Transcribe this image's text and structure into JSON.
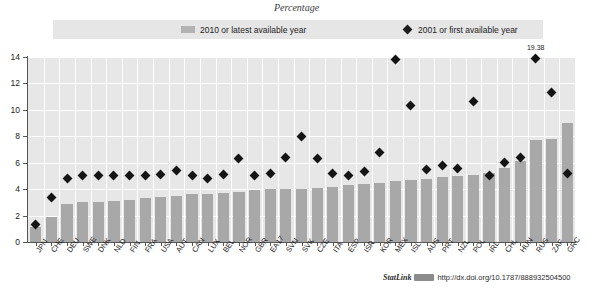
{
  "title": "Percentage",
  "legend": {
    "bar_label": "2010 or latest available year",
    "diamond_label": "2001 or first available year",
    "bar_color": "#b3b3b3",
    "diamond_color": "#1c1c1c"
  },
  "footer": {
    "statlink_word": "StatLink",
    "statlink_icon": "statlink-badge-icon",
    "url": "http://dx.doi.org/10.1787/888932504500"
  },
  "annotation": {
    "text": "19.38",
    "category": "RUS"
  },
  "chart_data": {
    "type": "bar",
    "title": "Percentage",
    "xlabel": "",
    "ylabel": "Percentage",
    "ylim": [
      0,
      14
    ],
    "yticks": [
      0,
      2,
      4,
      6,
      8,
      10,
      12,
      14
    ],
    "grid": true,
    "legend_position": "top",
    "categories": [
      "JPN",
      "CHE",
      "DEU",
      "SWE",
      "DNK",
      "NLD",
      "FIN",
      "FRA",
      "USA",
      "AUT",
      "CAN",
      "LUX",
      "BEL",
      "NOR",
      "GBR",
      "EA17",
      "SVN",
      "SVK",
      "CZE",
      "ITA",
      "ESP",
      "ISR",
      "KOR",
      "MEX",
      "ISL",
      "AUS",
      "PRT",
      "NZL",
      "POL",
      "IRL",
      "CHL",
      "HUN",
      "RUS",
      "ZAF",
      "GRC"
    ],
    "series": [
      {
        "name": "2010 or latest available year",
        "type": "bar",
        "values": [
          1.1,
          1.9,
          2.9,
          3.0,
          3.0,
          3.1,
          3.2,
          3.3,
          3.4,
          3.5,
          3.6,
          3.6,
          3.7,
          3.8,
          3.9,
          4.0,
          4.0,
          4.0,
          4.1,
          4.2,
          4.3,
          4.4,
          4.5,
          4.6,
          4.7,
          4.8,
          4.9,
          5.0,
          5.1,
          5.2,
          5.6,
          6.1,
          7.7,
          7.8,
          9.0
        ]
      },
      {
        "name": "2001 or first available year",
        "type": "scatter",
        "values": [
          1.3,
          3.4,
          4.8,
          5.0,
          5.0,
          5.0,
          5.0,
          5.0,
          5.1,
          5.4,
          5.0,
          4.8,
          5.1,
          6.3,
          5.0,
          5.2,
          6.4,
          8.0,
          6.3,
          5.2,
          5.0,
          5.3,
          6.8,
          13.8,
          10.3,
          5.5,
          5.8,
          5.6,
          10.6,
          5.0,
          6.0,
          6.4,
          13.9,
          11.3,
          5.2
        ]
      }
    ]
  }
}
